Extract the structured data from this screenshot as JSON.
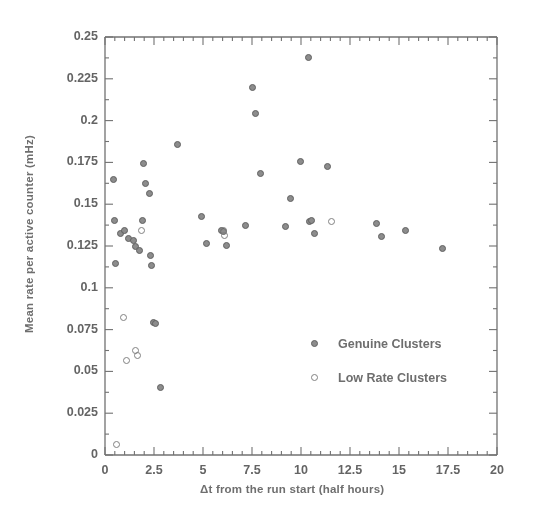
{
  "chart_data": {
    "type": "scatter",
    "title": "",
    "xlabel": "Δt from the run start (half hours)",
    "ylabel": "Mean rate per active counter (mHz)",
    "xlim": [
      0,
      20
    ],
    "ylim": [
      0,
      0.25
    ],
    "xticks": [
      0,
      2.5,
      5,
      7.5,
      10,
      12.5,
      15,
      17.5,
      20
    ],
    "xtick_labels": [
      "0",
      "2.5",
      "5",
      "7.5",
      "10",
      "12.5",
      "15",
      "17.5",
      "20"
    ],
    "yticks": [
      0,
      0.025,
      0.05,
      0.075,
      0.1,
      0.125,
      0.15,
      0.175,
      0.2,
      0.225,
      0.25
    ],
    "ytick_labels": [
      "0",
      "0.025",
      "0.05",
      "0.075",
      "0.1",
      "0.125",
      "0.15",
      "0.175",
      "0.2",
      "0.225",
      "0.25"
    ],
    "x_minor_tick_interval": 0.5,
    "y_minor_tick_interval": 0.0125,
    "grid": false,
    "legend_position": "center-right",
    "marker_color": "#8a8a8a",
    "marker_edge_color": "#5c5c5c",
    "series": [
      {
        "name": "Genuine Clusters",
        "marker": "filled-circle",
        "points": [
          [
            0.45,
            0.1645
          ],
          [
            0.5,
            0.1405
          ],
          [
            0.55,
            0.1145
          ],
          [
            0.8,
            0.1325
          ],
          [
            1.0,
            0.1345
          ],
          [
            1.2,
            0.1295
          ],
          [
            1.45,
            0.1285
          ],
          [
            1.55,
            0.1245
          ],
          [
            1.75,
            0.1225
          ],
          [
            1.9,
            0.1405
          ],
          [
            1.95,
            0.1745
          ],
          [
            2.05,
            0.1625
          ],
          [
            2.25,
            0.1565
          ],
          [
            2.3,
            0.1195
          ],
          [
            2.35,
            0.1135
          ],
          [
            2.45,
            0.0795
          ],
          [
            2.6,
            0.0785
          ],
          [
            2.85,
            0.0405
          ],
          [
            3.7,
            0.1855
          ],
          [
            4.9,
            0.1425
          ],
          [
            5.2,
            0.1265
          ],
          [
            5.95,
            0.1345
          ],
          [
            6.05,
            0.1335
          ],
          [
            6.2,
            0.1255
          ],
          [
            7.15,
            0.1375
          ],
          [
            7.5,
            0.2195
          ],
          [
            7.7,
            0.2045
          ],
          [
            7.95,
            0.1685
          ],
          [
            9.2,
            0.1365
          ],
          [
            9.45,
            0.1535
          ],
          [
            9.95,
            0.1755
          ],
          [
            10.4,
            0.2375
          ],
          [
            10.45,
            0.1395
          ],
          [
            10.55,
            0.1405
          ],
          [
            10.7,
            0.1325
          ],
          [
            11.35,
            0.1725
          ],
          [
            13.85,
            0.1385
          ],
          [
            14.1,
            0.1305
          ],
          [
            15.35,
            0.1345
          ],
          [
            17.2,
            0.1235
          ]
        ]
      },
      {
        "name": "Low Rate Clusters",
        "marker": "open-circle",
        "points": [
          [
            0.6,
            0.0065
          ],
          [
            0.95,
            0.0825
          ],
          [
            1.1,
            0.0565
          ],
          [
            1.55,
            0.0625
          ],
          [
            1.65,
            0.0595
          ],
          [
            1.85,
            0.1345
          ],
          [
            6.05,
            0.1345
          ],
          [
            6.1,
            0.1315
          ],
          [
            11.55,
            0.1395
          ]
        ]
      }
    ]
  },
  "legend": {
    "entries": [
      {
        "label": "Genuine Clusters",
        "marker": "filled-circle"
      },
      {
        "label": "Low Rate Clusters",
        "marker": "open-circle"
      }
    ]
  }
}
